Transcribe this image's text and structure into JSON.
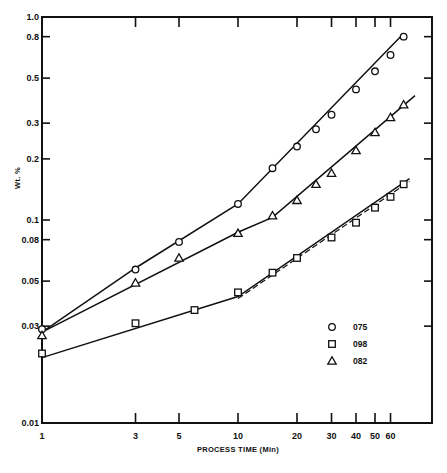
{
  "chart_data": {
    "type": "line",
    "title": "",
    "xlabel": "PROCESS TIME (Min)",
    "ylabel": "Wt. %",
    "xscale": "log",
    "yscale": "log",
    "xlim": [
      1,
      90
    ],
    "ylim": [
      0.01,
      1.0
    ],
    "grid": false,
    "legend_position": "lower right (inside plot)",
    "x_ticks": [
      1,
      3,
      5,
      10,
      20,
      30,
      40,
      50,
      60
    ],
    "x_tick_labels": [
      "1",
      "3",
      "5",
      "10",
      "20",
      "30",
      "40",
      "50",
      "60"
    ],
    "y_ticks": [
      0.01,
      0.03,
      0.05,
      0.08,
      0.1,
      0.2,
      0.3,
      0.5,
      0.8,
      1.0
    ],
    "y_tick_labels": [
      "0.01",
      "0.03",
      "0.05",
      "0.08",
      "0.1",
      "0.2",
      "0.3",
      "0.5",
      "0.8",
      "1.0"
    ],
    "series": [
      {
        "name": "075",
        "marker": "circle",
        "x": [
          1,
          3,
          5,
          10,
          15,
          20,
          25,
          30,
          40,
          50,
          60,
          70
        ],
        "y": [
          0.029,
          0.057,
          0.078,
          0.12,
          0.18,
          0.23,
          0.28,
          0.33,
          0.44,
          0.54,
          0.65,
          0.8
        ],
        "fit_line": [
          [
            1,
            0.028
          ],
          [
            3,
            0.058
          ],
          [
            10,
            0.12
          ],
          [
            70,
            0.83
          ]
        ]
      },
      {
        "name": "098",
        "marker": "square",
        "x": [
          1,
          3,
          6,
          10,
          15,
          20,
          30,
          40,
          50,
          60,
          70
        ],
        "y": [
          0.022,
          0.031,
          0.036,
          0.044,
          0.055,
          0.065,
          0.082,
          0.097,
          0.115,
          0.13,
          0.15
        ],
        "fit_line": [
          [
            1,
            0.021
          ],
          [
            10,
            0.042
          ],
          [
            75,
            0.16
          ]
        ],
        "dashed_fit_line": [
          [
            10,
            0.041
          ],
          [
            75,
            0.155
          ]
        ]
      },
      {
        "name": "082",
        "marker": "triangle",
        "x": [
          1,
          3,
          5,
          10,
          15,
          20,
          25,
          30,
          40,
          50,
          60,
          70
        ],
        "y": [
          0.027,
          0.049,
          0.065,
          0.086,
          0.105,
          0.125,
          0.15,
          0.17,
          0.22,
          0.27,
          0.32,
          0.37
        ],
        "fit_line": [
          [
            1,
            0.028
          ],
          [
            10,
            0.087
          ],
          [
            15,
            0.103
          ],
          [
            80,
            0.41
          ]
        ]
      }
    ]
  },
  "legend": {
    "items": [
      {
        "marker": "circle",
        "label": "075"
      },
      {
        "marker": "square",
        "label": "098"
      },
      {
        "marker": "triangle",
        "label": "082"
      }
    ]
  },
  "axes": {
    "x_title": "PROCESS TIME (Min)",
    "y_title": "Wt. %"
  },
  "colors": {
    "ink": "#111111",
    "background": "#ffffff"
  }
}
